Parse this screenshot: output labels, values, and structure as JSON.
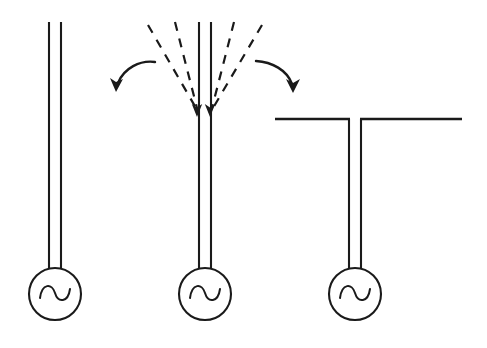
{
  "figure": {
    "type": "schematic-diagram",
    "background_color": "#ffffff",
    "line_color": "#1a1a1a",
    "canvas": {
      "width": 487,
      "height": 348
    }
  },
  "stages": [
    {
      "id": "stage-1",
      "name": "open-ended-transmission-line",
      "label": "",
      "source": {
        "symbol": "ac-source",
        "glyph": "~",
        "cx": 55,
        "cy": 294,
        "r": 26
      },
      "line": {
        "left_conductor_x": 49,
        "right_conductor_x": 61,
        "top_y": 22,
        "bottom_y": 270
      }
    },
    {
      "id": "stage-2",
      "name": "transmission-line-with-flaring-fields",
      "label": "",
      "source": {
        "symbol": "ac-source",
        "glyph": "~",
        "cx": 205,
        "cy": 294,
        "r": 26
      },
      "line": {
        "left_conductor_x": 199,
        "right_conductor_x": 211,
        "top_y": 22,
        "bottom_y": 270
      },
      "dashed_rays": [
        {
          "name": "dashed-ray-outer-left",
          "x1": 148,
          "y1": 25,
          "x2": 196,
          "y2": 110
        },
        {
          "name": "dashed-ray-inner-left",
          "x1": 175,
          "y1": 22,
          "x2": 197,
          "y2": 110
        },
        {
          "name": "dashed-ray-inner-right",
          "x1": 234,
          "y1": 22,
          "x2": 212,
          "y2": 110
        },
        {
          "name": "dashed-ray-outer-right",
          "x1": 262,
          "y1": 25,
          "x2": 213,
          "y2": 110
        }
      ],
      "convergence_arrows": [
        {
          "name": "down-arrow-left",
          "x": 196,
          "tip_y": 116
        },
        {
          "name": "down-arrow-right",
          "x": 209,
          "tip_y": 116
        }
      ],
      "curved_arrows": [
        {
          "name": "curved-arrow-left",
          "direction": "down-left",
          "start_x": 154,
          "start_y": 62,
          "end_x": 117,
          "end_y": 90
        },
        {
          "name": "curved-arrow-right",
          "direction": "down-right",
          "start_x": 256,
          "start_y": 60,
          "end_x": 292,
          "end_y": 90
        }
      ]
    },
    {
      "id": "stage-3",
      "name": "dipole-antenna",
      "label": "",
      "source": {
        "symbol": "ac-source",
        "glyph": "~",
        "cx": 355,
        "cy": 294,
        "r": 26
      },
      "line": {
        "left_conductor_x": 349,
        "right_conductor_x": 361,
        "top_y": 119,
        "bottom_y": 270
      },
      "arms": {
        "y": 119,
        "left_arm": {
          "name": "dipole-arm-left",
          "x_start": 275,
          "x_end": 349
        },
        "right_arm": {
          "name": "dipole-arm-right",
          "x_start": 361,
          "x_end": 462
        }
      }
    }
  ]
}
